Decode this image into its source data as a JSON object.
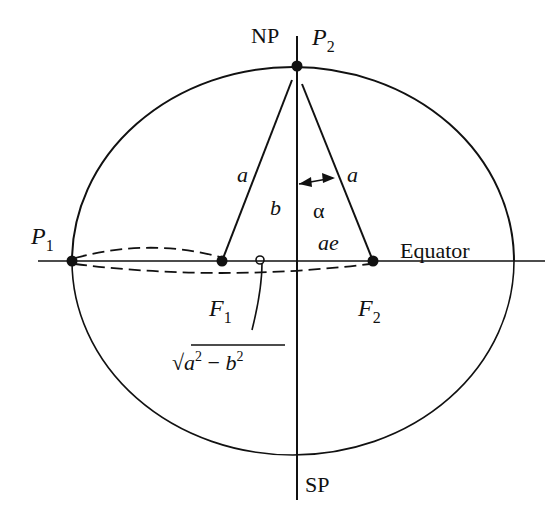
{
  "figure": {
    "colors": {
      "ink": "#111111",
      "background": "#ffffff"
    }
  },
  "labels": {
    "north_pole": "NP",
    "south_pole": "SP",
    "p1": {
      "base": "P",
      "sub": "1"
    },
    "p2": {
      "base": "P",
      "sub": "2"
    },
    "f1": {
      "base": "F",
      "sub": "1"
    },
    "f2": {
      "base": "F",
      "sub": "2"
    },
    "equator": "Equator",
    "semi_major_left": "a",
    "semi_major_right": "a",
    "semi_minor": "b",
    "angle": "α",
    "focal_distance": "ae",
    "sqrt_expression": {
      "radical": "√",
      "a": "a",
      "exp_a": "2",
      "minus": " − ",
      "b": "b",
      "exp_b": "2"
    }
  }
}
